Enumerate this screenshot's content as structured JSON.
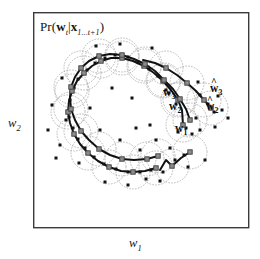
{
  "figure": {
    "domain_type": "chart",
    "background_color": "#ffffff",
    "frame": {
      "name": "plot-frame",
      "x": 33,
      "y": 12,
      "width": 216,
      "height": 216,
      "stroke": "#3a3a3a",
      "stroke_width": 1.4,
      "fill": "#ffffff"
    },
    "title": {
      "text": "Pr(w_t|x_1...t+1)",
      "parts": {
        "pr": "Pr",
        "open": "(",
        "w": "w",
        "w_sub": "t",
        "bar": "|",
        "x": "x",
        "x_sub": "1...t+1",
        "close": ")"
      }
    },
    "axes": {
      "x_label": "w",
      "x_label_sub": "1",
      "y_label": "w",
      "y_label_sub": "2"
    },
    "labels": [
      {
        "id": "label-w3",
        "text": "w",
        "sub": "3",
        "hat": false,
        "x": 163,
        "y": 86
      },
      {
        "id": "label-w2",
        "text": "w",
        "sub": "2",
        "hat": false,
        "x": 169,
        "y": 100
      },
      {
        "id": "label-w1",
        "text": "w",
        "sub": "1",
        "hat": false,
        "x": 175,
        "y": 122
      },
      {
        "id": "label-what3",
        "text": "w",
        "sub": "3",
        "hat": true,
        "x": 210,
        "y": 82
      },
      {
        "id": "label-what2",
        "text": "w",
        "sub": "2",
        "hat": true,
        "x": 206,
        "y": 100
      }
    ],
    "colors": {
      "frame_stroke": "#3a3a3a",
      "trajectory_line": "#111111",
      "node_fill": "#8c8c8c",
      "node_stroke": "#3d3d3d",
      "sample_dot": "#111111",
      "uncertainty_circle": "#a9a9a9"
    },
    "legend_note": {
      "dotted_circles": "uncertainty-circle",
      "gray_squares": "particle-node",
      "black_dots": "sample-point",
      "black_lines": "particle-trajectory"
    }
  },
  "chart_data": {
    "type": "scatter",
    "xlabel": "w_1",
    "ylabel": "w_2",
    "xlim": [
      33,
      249
    ],
    "ylim": [
      12,
      228
    ],
    "grid": false,
    "legend": "none",
    "annotations": [
      "w_3",
      "w_2",
      "w_1",
      "what_3",
      "what_2"
    ],
    "uncertainty_radius": 17,
    "series": [
      {
        "name": "particle-trajectory-main",
        "type": "line",
        "points": [
          [
            183,
            125
          ],
          [
            182,
            110
          ],
          [
            178,
            100
          ],
          [
            171,
            90
          ],
          [
            163,
            81
          ],
          [
            154,
            73
          ],
          [
            144,
            66
          ],
          [
            133,
            61
          ],
          [
            122,
            58
          ],
          [
            111,
            58
          ],
          [
            101,
            61
          ],
          [
            92,
            66
          ],
          [
            84,
            73
          ],
          [
            77,
            81
          ],
          [
            72,
            91
          ],
          [
            69,
            101
          ],
          [
            68,
            112
          ],
          [
            70,
            123
          ],
          [
            74,
            134
          ],
          [
            80,
            144
          ],
          [
            88,
            153
          ],
          [
            98,
            161
          ],
          [
            109,
            167
          ],
          [
            121,
            171
          ],
          [
            133,
            172
          ],
          [
            145,
            171
          ],
          [
            156,
            168
          ]
        ]
      },
      {
        "name": "particle-trajectory-secondary",
        "type": "line",
        "points": [
          [
            190,
            120
          ],
          [
            186,
            109
          ],
          [
            180,
            99
          ],
          [
            173,
            89
          ],
          [
            164,
            80
          ],
          [
            155,
            71
          ],
          [
            145,
            64
          ],
          [
            134,
            59
          ],
          [
            122,
            55
          ],
          [
            110,
            54
          ],
          [
            99,
            56
          ],
          [
            89,
            61
          ],
          [
            81,
            68
          ],
          [
            75,
            77
          ],
          [
            71,
            87
          ],
          [
            70,
            98
          ],
          [
            71,
            109
          ],
          [
            75,
            120
          ],
          [
            81,
            131
          ],
          [
            89,
            140
          ],
          [
            99,
            149
          ],
          [
            110,
            155
          ],
          [
            122,
            159
          ],
          [
            134,
            160
          ],
          [
            147,
            159
          ],
          [
            158,
            156
          ]
        ]
      },
      {
        "name": "particle-trajectory-branch-right",
        "type": "line",
        "points": [
          [
            143,
            60
          ],
          [
            155,
            63
          ],
          [
            166,
            68
          ],
          [
            177,
            75
          ],
          [
            187,
            83
          ],
          [
            196,
            91
          ],
          [
            204,
            100
          ],
          [
            211,
            108
          ]
        ]
      },
      {
        "name": "particle-trajectory-branch-bottom",
        "type": "line",
        "points": [
          [
            160,
            170
          ],
          [
            166,
            160
          ],
          [
            172,
            166
          ],
          [
            181,
            158
          ],
          [
            190,
            152
          ]
        ]
      }
    ],
    "nodes": [
      [
        183,
        125
      ],
      [
        178,
        100
      ],
      [
        163,
        81
      ],
      [
        144,
        66
      ],
      [
        122,
        58
      ],
      [
        101,
        61
      ],
      [
        84,
        73
      ],
      [
        72,
        91
      ],
      [
        68,
        112
      ],
      [
        74,
        134
      ],
      [
        88,
        153
      ],
      [
        109,
        167
      ],
      [
        133,
        172
      ],
      [
        156,
        168
      ],
      [
        190,
        120
      ],
      [
        180,
        99
      ],
      [
        164,
        80
      ],
      [
        145,
        64
      ],
      [
        122,
        55
      ],
      [
        99,
        56
      ],
      [
        81,
        68
      ],
      [
        71,
        87
      ],
      [
        71,
        109
      ],
      [
        81,
        131
      ],
      [
        99,
        149
      ],
      [
        122,
        159
      ],
      [
        147,
        159
      ],
      [
        166,
        68
      ],
      [
        187,
        83
      ],
      [
        204,
        100
      ],
      [
        172,
        166
      ],
      [
        190,
        152
      ],
      [
        158,
        156
      ],
      [
        211,
        108
      ]
    ],
    "sample_points": [
      [
        186,
        128
      ],
      [
        176,
        104
      ],
      [
        169,
        93
      ],
      [
        158,
        76
      ],
      [
        149,
        69
      ],
      [
        138,
        62
      ],
      [
        128,
        57
      ],
      [
        115,
        55
      ],
      [
        105,
        58
      ],
      [
        95,
        63
      ],
      [
        87,
        70
      ],
      [
        78,
        79
      ],
      [
        74,
        88
      ],
      [
        70,
        100
      ],
      [
        69,
        117
      ],
      [
        73,
        128
      ],
      [
        78,
        139
      ],
      [
        85,
        148
      ],
      [
        94,
        157
      ],
      [
        104,
        164
      ],
      [
        116,
        169
      ],
      [
        128,
        172
      ],
      [
        140,
        172
      ],
      [
        151,
        170
      ],
      [
        163,
        172
      ],
      [
        175,
        160
      ],
      [
        184,
        155
      ],
      [
        196,
        118
      ],
      [
        200,
        95
      ],
      [
        208,
        104
      ],
      [
        214,
        112
      ],
      [
        218,
        96
      ],
      [
        215,
        127
      ],
      [
        200,
        130
      ],
      [
        192,
        134
      ],
      [
        178,
        132
      ],
      [
        166,
        90
      ],
      [
        152,
        48
      ],
      [
        120,
        44
      ],
      [
        96,
        46
      ],
      [
        62,
        78
      ],
      [
        52,
        105
      ],
      [
        48,
        130
      ],
      [
        56,
        158
      ],
      [
        66,
        120
      ],
      [
        60,
        145
      ],
      [
        79,
        163
      ],
      [
        105,
        182
      ],
      [
        128,
        185
      ],
      [
        146,
        179
      ],
      [
        160,
        181
      ],
      [
        188,
        167
      ],
      [
        205,
        160
      ],
      [
        150,
        125
      ],
      [
        140,
        150
      ],
      [
        132,
        98
      ],
      [
        112,
        88
      ],
      [
        90,
        108
      ],
      [
        100,
        130
      ],
      [
        120,
        140
      ],
      [
        136,
        128
      ],
      [
        170,
        148
      ],
      [
        156,
        140
      ],
      [
        198,
        82
      ],
      [
        222,
        110
      ],
      [
        228,
        118
      ]
    ]
  }
}
